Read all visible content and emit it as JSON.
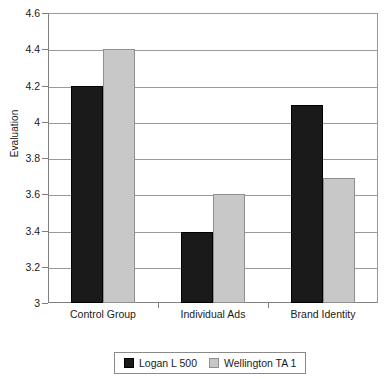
{
  "chart_data": {
    "type": "bar",
    "title": "",
    "subtitle": "",
    "xlabel": "",
    "ylabel": "Evaluation",
    "categories": [
      "Control Group",
      "Individual Ads",
      "Brand Identity"
    ],
    "series": [
      {
        "name": "Logan L 500",
        "color": "#1a1a1a",
        "values": [
          4.2,
          3.39,
          4.09
        ]
      },
      {
        "name": "Wellington TA 1",
        "color": "#c8c8c8",
        "values": [
          4.4,
          3.6,
          3.69
        ]
      }
    ],
    "ylim": [
      3,
      4.6
    ],
    "ytick_step": 0.2,
    "yticks": [
      "3",
      "3.2",
      "3.4",
      "3.6",
      "3.8",
      "4",
      "4.2",
      "4.4",
      "4.6"
    ],
    "ytick_values": [
      3,
      3.2,
      3.4,
      3.6,
      3.8,
      4,
      4.2,
      4.4,
      4.6
    ],
    "grid": true,
    "grid_axis": "y",
    "legend_position": "bottom-center",
    "background_color": "#ffffff",
    "grid_color": "#9a9a9a",
    "axis_color": "#808080"
  }
}
